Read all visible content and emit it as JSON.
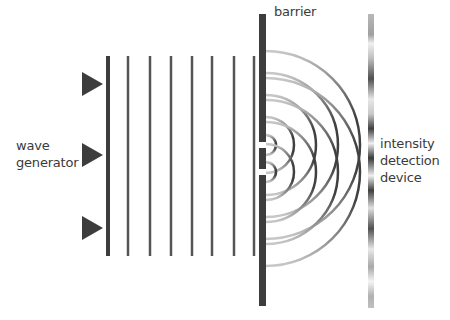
{
  "diagram": {
    "labels": {
      "wave_generator": [
        "wave",
        "generator"
      ],
      "barrier": "barrier",
      "detector": [
        "intensity",
        "detection",
        "device"
      ]
    },
    "colors": {
      "dark": "#3d3d3d",
      "line": "#555555",
      "arc_light": "#c8c8c8",
      "arc_dark": "#404040",
      "text": "#3a3a3a"
    },
    "wave_generator": {
      "triangle_centers_y": [
        84,
        155,
        228
      ],
      "triangle_x": 82,
      "triangle_width": 21,
      "triangle_height": 24
    },
    "plane_waves": {
      "x_positions": [
        108,
        128,
        150,
        171,
        192,
        212,
        234,
        254
      ],
      "y_top": 56,
      "y_bottom": 256,
      "first_line_width": 4,
      "line_width": 2.5
    },
    "barrier": {
      "x": 259,
      "width": 7,
      "y_top": 14,
      "y_bottom": 306,
      "slits": [
        {
          "y_center": 145,
          "height": 6
        },
        {
          "y_center": 172,
          "height": 6
        }
      ]
    },
    "circular_waves": {
      "radii": [
        10,
        28,
        50,
        72,
        94
      ]
    },
    "detector": {
      "x": 368,
      "width": 6,
      "y_top": 14,
      "y_bottom": 308,
      "intensity_stops": [
        {
          "offset": 0.0,
          "shade": "#b8b8b8"
        },
        {
          "offset": 0.07,
          "shade": "#a0a0a0"
        },
        {
          "offset": 0.1,
          "shade": "#f0f0f0"
        },
        {
          "offset": 0.15,
          "shade": "#c0c0c0"
        },
        {
          "offset": 0.22,
          "shade": "#505050"
        },
        {
          "offset": 0.29,
          "shade": "#e8e8e8"
        },
        {
          "offset": 0.34,
          "shade": "#c8c8c8"
        },
        {
          "offset": 0.39,
          "shade": "#404040"
        },
        {
          "offset": 0.44,
          "shade": "#f0f0f0"
        },
        {
          "offset": 0.49,
          "shade": "#3a3a3a"
        },
        {
          "offset": 0.55,
          "shade": "#f0f0f0"
        },
        {
          "offset": 0.6,
          "shade": "#404040"
        },
        {
          "offset": 0.66,
          "shade": "#e0e0e0"
        },
        {
          "offset": 0.73,
          "shade": "#505050"
        },
        {
          "offset": 0.8,
          "shade": "#e8e8e8"
        },
        {
          "offset": 0.86,
          "shade": "#a8a8a8"
        },
        {
          "offset": 0.91,
          "shade": "#f4f4f4"
        },
        {
          "offset": 0.96,
          "shade": "#b0b0b0"
        },
        {
          "offset": 1.0,
          "shade": "#c0c0c0"
        }
      ]
    }
  }
}
